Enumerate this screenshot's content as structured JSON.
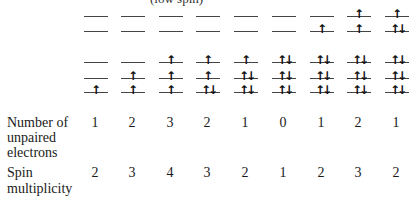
{
  "title_fragment": "(low spin)",
  "levels": {
    "eg_y": [
      16,
      31
    ],
    "t2g_y": [
      62,
      78,
      92
    ]
  },
  "columns": [
    {
      "x": 84,
      "eg": [
        "",
        ""
      ],
      "t2g": [
        "",
        "",
        "↑"
      ],
      "unpaired": "1",
      "multiplicity": "2"
    },
    {
      "x": 121,
      "eg": [
        "",
        ""
      ],
      "t2g": [
        "",
        "↑",
        "↑"
      ],
      "unpaired": "2",
      "multiplicity": "3"
    },
    {
      "x": 159,
      "eg": [
        "",
        ""
      ],
      "t2g": [
        "↑",
        "↑",
        "↑"
      ],
      "unpaired": "3",
      "multiplicity": "4"
    },
    {
      "x": 196,
      "eg": [
        "",
        ""
      ],
      "t2g": [
        "↑",
        "↑",
        "↑↓"
      ],
      "unpaired": "2",
      "multiplicity": "3"
    },
    {
      "x": 234,
      "eg": [
        "",
        ""
      ],
      "t2g": [
        "↑",
        "↑↓",
        "↑↓"
      ],
      "unpaired": "1",
      "multiplicity": "2"
    },
    {
      "x": 272,
      "eg": [
        "",
        ""
      ],
      "t2g": [
        "↑↓",
        "↑↓",
        "↑↓"
      ],
      "unpaired": "0",
      "multiplicity": "1"
    },
    {
      "x": 310,
      "eg": [
        "",
        "↑"
      ],
      "t2g": [
        "↑↓",
        "↑↓",
        "↑↓"
      ],
      "unpaired": "1",
      "multiplicity": "2"
    },
    {
      "x": 347,
      "eg": [
        "↑",
        "↑"
      ],
      "t2g": [
        "↑↓",
        "↑↓",
        "↑↓"
      ],
      "unpaired": "2",
      "multiplicity": "3"
    },
    {
      "x": 385,
      "eg": [
        "↑",
        "↑↓"
      ],
      "t2g": [
        "↑↓",
        "↑↓",
        "↑↓"
      ],
      "unpaired": "1",
      "multiplicity": "2"
    }
  ],
  "rows": {
    "unpaired_label": [
      "Number of",
      "unpaired",
      "electrons"
    ],
    "multiplicity_label": [
      "Spin",
      "multiplicity"
    ]
  }
}
